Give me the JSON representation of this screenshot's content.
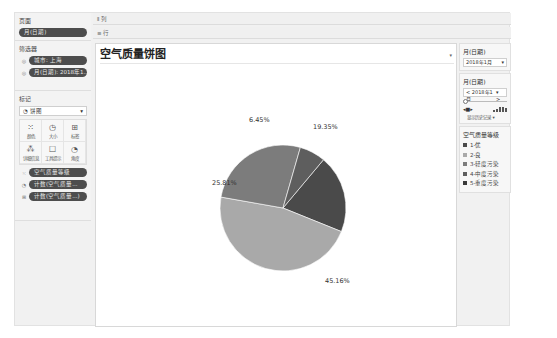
{
  "left": {
    "pages": {
      "title": "页面",
      "pill": "月(日期)"
    },
    "filters": {
      "title": "筛选器",
      "items": [
        {
          "label": "城市: 上海"
        },
        {
          "label": "月(日期): 2018年1..."
        }
      ]
    },
    "marks": {
      "title": "标记",
      "type": "饼图",
      "buttons": [
        {
          "icon": "⁙",
          "label": "颜色",
          "name": "color"
        },
        {
          "icon": "◷",
          "label": "大小",
          "name": "size"
        },
        {
          "icon": "⊞",
          "label": "标签",
          "name": "label"
        },
        {
          "icon": "⁂",
          "label": "详细信息",
          "name": "detail"
        },
        {
          "icon": "☐",
          "label": "工具提示",
          "name": "tooltip"
        },
        {
          "icon": "◔",
          "label": "角度",
          "name": "angle"
        }
      ],
      "fields": [
        {
          "icon": "⁙",
          "label": "空气质量等级"
        },
        {
          "icon": "◔",
          "label": "计数(空气质量..."
        },
        {
          "icon": "⊞",
          "label": "计数(空气质量...)"
        }
      ]
    }
  },
  "shelves": {
    "columns": {
      "icon": "⫴",
      "label": "列"
    },
    "rows": {
      "icon": "≡",
      "label": "行"
    }
  },
  "chart_data": {
    "type": "pie",
    "title": "空气质量饼图",
    "categories": [
      "1-优",
      "2-良",
      "3-轻度污染",
      "4-中度污染",
      "5-重度污染"
    ],
    "slices": [
      {
        "label": "19.35%",
        "value": 19.35,
        "color": "#4a4a4a"
      },
      {
        "label": "45.16%",
        "value": 45.16,
        "color": "#a9a9a9"
      },
      {
        "label": "25.81%",
        "value": 25.81,
        "color": "#7c7c7c"
      },
      {
        "label": "6.45%",
        "value": 6.45,
        "color": "#5e5e5e"
      }
    ],
    "legend_position": "right"
  },
  "right": {
    "filter1": {
      "title": "月(日期)",
      "value": "2018年1月"
    },
    "filter2": {
      "title": "月(日期)",
      "value": "2018年1月",
      "prev": "<",
      "next": ">",
      "show_history": "显示历史记录 ▾"
    },
    "legend": {
      "title": "空气质量等级",
      "items": [
        {
          "label": "1-优",
          "color": "#4a4a4a"
        },
        {
          "label": "2-良",
          "color": "#a9a9a9"
        },
        {
          "label": "3-轻度污染",
          "color": "#7c7c7c"
        },
        {
          "label": "4-中度污染",
          "color": "#5e5e5e"
        },
        {
          "label": "5-重度污染",
          "color": "#3a3a3a"
        }
      ]
    }
  }
}
